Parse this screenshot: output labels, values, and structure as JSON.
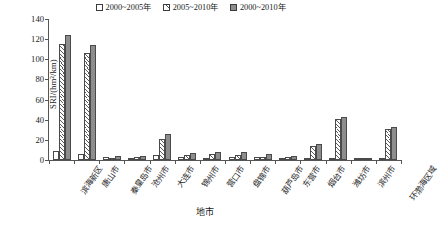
{
  "chart_data": {
    "type": "bar",
    "title": "",
    "xlabel": "地市",
    "ylabel": "SRI/(hm²/km)",
    "ylim": [
      0,
      140
    ],
    "yticks": [
      0,
      20,
      40,
      60,
      80,
      100,
      120,
      140
    ],
    "grid": false,
    "legend_position": "top-right",
    "categories": [
      "滨海新区",
      "唐山市",
      "秦皇岛市",
      "沧州市",
      "大连市",
      "锦州市",
      "营口市",
      "盘锦市",
      "葫芦岛市",
      "东营市",
      "烟台市",
      "潍坊市",
      "滨州市",
      "环渤海区域"
    ],
    "series": [
      {
        "name": "2000~2005年",
        "values": [
          9,
          6,
          3,
          1,
          5,
          3,
          2,
          3,
          3,
          1,
          2,
          2,
          1,
          1
        ]
      },
      {
        "name": "2005~2010年",
        "values": [
          115,
          106,
          1,
          3,
          21,
          5,
          6,
          5,
          3,
          3,
          14,
          41,
          1,
          31
        ]
      },
      {
        "name": "2000~2010年",
        "values": [
          124,
          114,
          4,
          4,
          26,
          7,
          8,
          8,
          6,
          4,
          16,
          43,
          2,
          33
        ]
      }
    ],
    "colors": {
      "series1": "#ffffff",
      "series2": "#ffffff",
      "series3": "#8d8d8d",
      "axis": "#555555"
    }
  },
  "legend": {
    "items": [
      {
        "label": "2000~2005年",
        "swatch": "white-square"
      },
      {
        "label": "2005~2010年",
        "swatch": "hatched-square"
      },
      {
        "label": "2000~2010年",
        "swatch": "gray-square"
      }
    ]
  },
  "axes": {
    "y": {
      "title": "SRI/(hm²/km)",
      "ticks": [
        "0",
        "20",
        "40",
        "60",
        "80",
        "100",
        "120",
        "140"
      ]
    },
    "x": {
      "title": "地市",
      "ticks": [
        "滨海新区",
        "唐山市",
        "秦皇岛市",
        "沧州市",
        "大连市",
        "锦州市",
        "营口市",
        "盘锦市",
        "葫芦岛市",
        "东营市",
        "烟台市",
        "潍坊市",
        "滨州市",
        "环渤海区域"
      ]
    }
  }
}
